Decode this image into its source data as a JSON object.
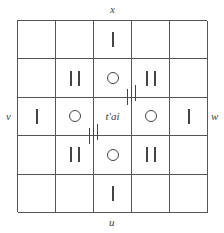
{
  "labels": {
    "top": "x",
    "bottom": "u",
    "left": "v",
    "right": "w"
  },
  "center_text": "t'ai",
  "grid": {
    "rows": 5,
    "cols": 5,
    "cells": [
      [
        "",
        "",
        "1",
        "",
        ""
      ],
      [
        "",
        "2",
        "o",
        "2",
        ""
      ],
      [
        "1",
        "o",
        "t'ai",
        "o",
        "1"
      ],
      [
        "",
        "2",
        "o",
        "2",
        ""
      ],
      [
        "",
        "",
        "1",
        "",
        ""
      ]
    ]
  },
  "tick_marks": [
    {
      "position": "upper-right-of-center",
      "count": 3
    },
    {
      "position": "lower-left-of-center",
      "count": 3
    }
  ]
}
